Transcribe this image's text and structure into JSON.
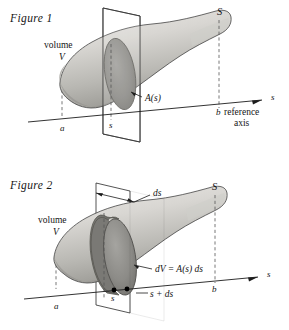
{
  "document": {
    "type": "mathematical-illustration",
    "subject": "volume-by-cross-sectional-area",
    "background_color": "#ffffff",
    "ink_color": "#151515"
  },
  "figure1": {
    "caption": "Figure 1",
    "labels": {
      "volume_word": "volume",
      "volume_symbol": "V",
      "surface_symbol": "S",
      "area_function": "A(s)",
      "axis_variable": "s",
      "lower_bound": "a",
      "upper_bound": "b",
      "cut_position": "s",
      "axis_name_line1": "reference",
      "axis_name_line2": "axis"
    },
    "icon_names": {
      "axis_arrow": "arrow-right-icon",
      "leader_line": "leader-line-icon",
      "cutting_plane": "cutting-plane-icon",
      "cross_section": "ellipse-cross-section-icon"
    }
  },
  "figure2": {
    "caption": "Figure 2",
    "labels": {
      "volume_word": "volume",
      "volume_symbol": "V",
      "surface_symbol": "S",
      "slab_thickness": "ds",
      "volume_element": "dV = A(s) ds",
      "axis_variable": "s",
      "lower_bound": "a",
      "upper_bound": "b",
      "cut_position": "s",
      "cut_position_plus": "s + ds"
    },
    "icon_names": {
      "axis_arrow": "arrow-right-icon",
      "dimension_arrow": "double-headed-arrow-icon",
      "leader_line": "leader-line-icon",
      "slab_disc": "disc-slab-icon",
      "axis_point_marker": "filled-dot-icon"
    }
  },
  "shading": {
    "solid_light": "#e3e2df",
    "solid_mid": "#c6c5c1",
    "solid_dark": "#9c9b97",
    "cross_section_face": "#8d8c88",
    "cross_section_rim": "#6f6e6a",
    "plane_tint": "#f2f2f0"
  }
}
